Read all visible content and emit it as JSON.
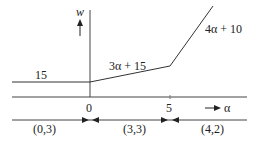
{
  "diagram": {
    "axes": {
      "y_label": "w",
      "x_label": "α",
      "x_ticks": [
        "0",
        "5"
      ]
    },
    "segments": [
      {
        "label": "15",
        "from": "-∞",
        "to": "0"
      },
      {
        "label": "3α + 15",
        "from": "0",
        "to": "5"
      },
      {
        "label": "4α + 10",
        "from": "5",
        "to": "∞"
      }
    ],
    "intervals": [
      {
        "label": "(0,3)"
      },
      {
        "label": "(3,3)"
      },
      {
        "label": "(4,2)"
      }
    ],
    "colors": {
      "line": "#333333",
      "text": "#222222",
      "background": "#ffffff"
    }
  }
}
